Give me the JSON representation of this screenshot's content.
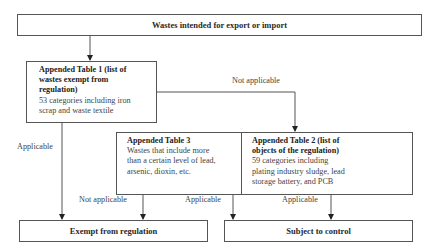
{
  "diagram": {
    "type": "flowchart",
    "nodes": {
      "start": {
        "label": "Wastes intended for export or import"
      },
      "table1": {
        "title": "Appended Table 1 (list of wastes exempt from regulation)",
        "title_lines": [
          "Appended Table 1 (list of",
          "wastes exempt from",
          "regulation)"
        ],
        "body_lines": [
          "53 categories including iron",
          "scrap and waste textile"
        ]
      },
      "table3": {
        "title": "Appended Table 3",
        "body_lines": [
          "Wastes that include more",
          "than a certain level of lead,",
          "arsenic, dioxin, etc."
        ]
      },
      "table2": {
        "title_lines": [
          "Appended Table 2 (list of",
          "objects of the regulation)"
        ],
        "body_lines": [
          "59 categories including",
          "plating industry sludge, lead",
          "storage battery, and PCB"
        ]
      },
      "exempt": {
        "label": "Exempt from regulation"
      },
      "subject": {
        "label": "Subject to control"
      }
    },
    "edges": {
      "t1_not_applicable": "Not applicable",
      "t1_applicable": "Applicable",
      "t3_not_applicable": "Not applicable",
      "t3_applicable": "Applicable",
      "t2_applicable": "Applicable"
    }
  }
}
